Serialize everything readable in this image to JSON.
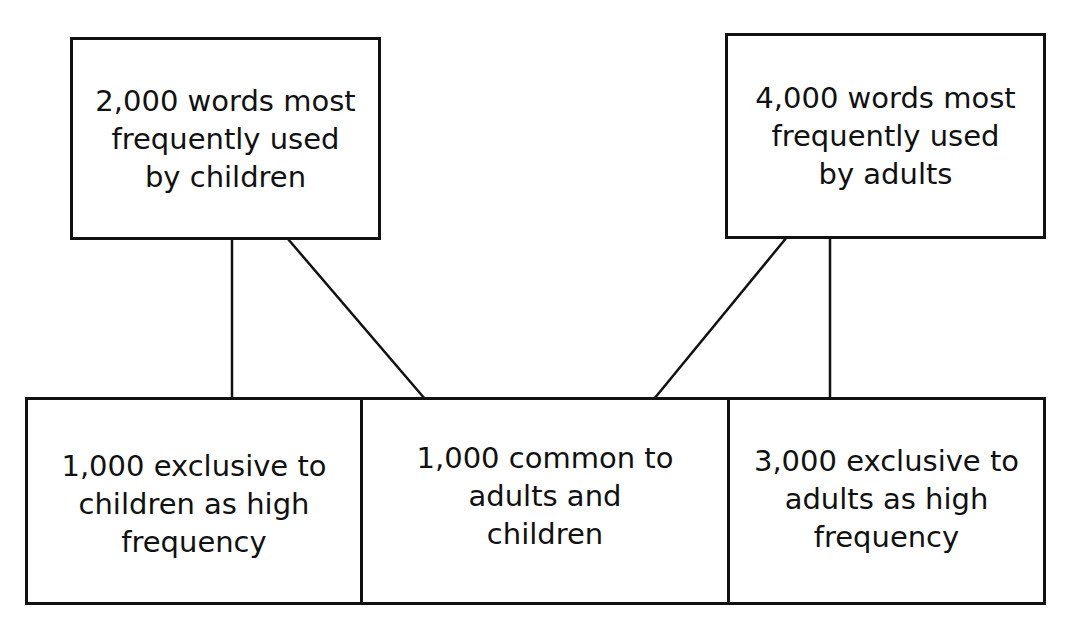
{
  "diagram": {
    "type": "tree",
    "top_boxes": [
      {
        "id": "children-words",
        "lines": [
          "2,000 words most",
          "frequently used",
          "by children"
        ]
      },
      {
        "id": "adult-words",
        "lines": [
          "4,000 words most",
          "frequently used",
          "by adults"
        ]
      }
    ],
    "bottom_boxes": [
      {
        "id": "children-exclusive",
        "lines": [
          "1,000 exclusive to",
          "children as high",
          "frequency"
        ]
      },
      {
        "id": "common",
        "lines": [
          "1,000 common to",
          "adults and",
          "children"
        ]
      },
      {
        "id": "adults-exclusive",
        "lines": [
          "3,000 exclusive to",
          "adults as high",
          "frequency"
        ]
      }
    ],
    "connections": [
      {
        "from": "children-words",
        "to": "children-exclusive"
      },
      {
        "from": "children-words",
        "to": "common"
      },
      {
        "from": "adult-words",
        "to": "common"
      },
      {
        "from": "adult-words",
        "to": "adults-exclusive"
      }
    ],
    "colors": {
      "stroke": "#111111",
      "background": "#ffffff"
    }
  }
}
